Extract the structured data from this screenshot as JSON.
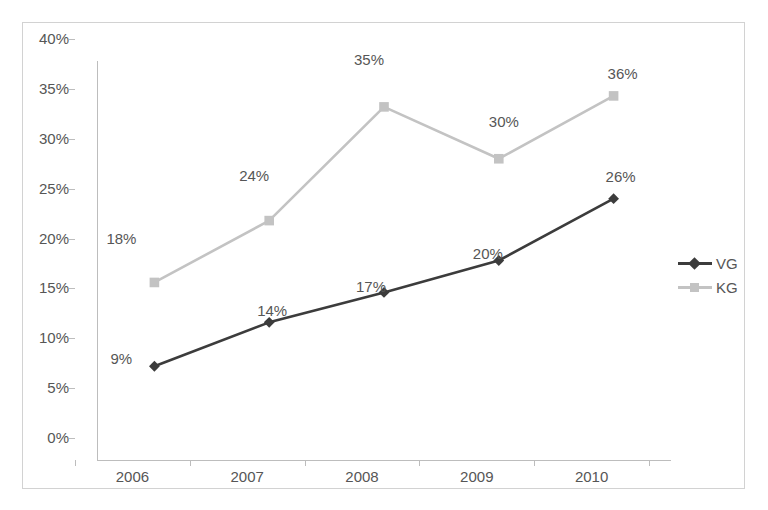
{
  "chart_data": {
    "type": "line",
    "title": "",
    "subtitle": "",
    "xlabel": "",
    "ylabel": "",
    "categories": [
      "2006",
      "2007",
      "2008",
      "2009",
      "2010"
    ],
    "x_tick_labels": [
      "2006",
      "2007",
      "2008",
      "2009",
      "2010"
    ],
    "y_tick_labels": [
      "0%",
      "5%",
      "10%",
      "15%",
      "20%",
      "25%",
      "30%",
      "35%",
      "40%"
    ],
    "y_tick_values": [
      0,
      5,
      10,
      15,
      20,
      25,
      30,
      35,
      40
    ],
    "ylim": [
      0,
      40
    ],
    "grid": false,
    "legend_position": "right",
    "series": [
      {
        "name": "VG",
        "color": "#3c3c3c",
        "marker": "diamond",
        "values": [
          9.4,
          13.8,
          16.8,
          20.0,
          26.2
        ],
        "data_labels": [
          "9%",
          "14%",
          "17%",
          "20%",
          "26%"
        ]
      },
      {
        "name": "KG",
        "color": "#c3c3c3",
        "marker": "square",
        "values": [
          17.8,
          24.0,
          35.4,
          30.2,
          36.5
        ],
        "data_labels": [
          "18%",
          "24%",
          "35%",
          "30%",
          "36%"
        ]
      }
    ]
  },
  "legend": {
    "items": [
      {
        "label": "VG",
        "color": "#3c3c3c",
        "marker": "diamond"
      },
      {
        "label": "KG",
        "color": "#c3c3c3",
        "marker": "square"
      }
    ]
  },
  "colors": {
    "vg_series": "#3c3c3c",
    "kg_series": "#c3c3c3",
    "axis": "#bdbdbd",
    "frame": "#d2d2d2",
    "text": "#565656",
    "background": "#ffffff"
  }
}
